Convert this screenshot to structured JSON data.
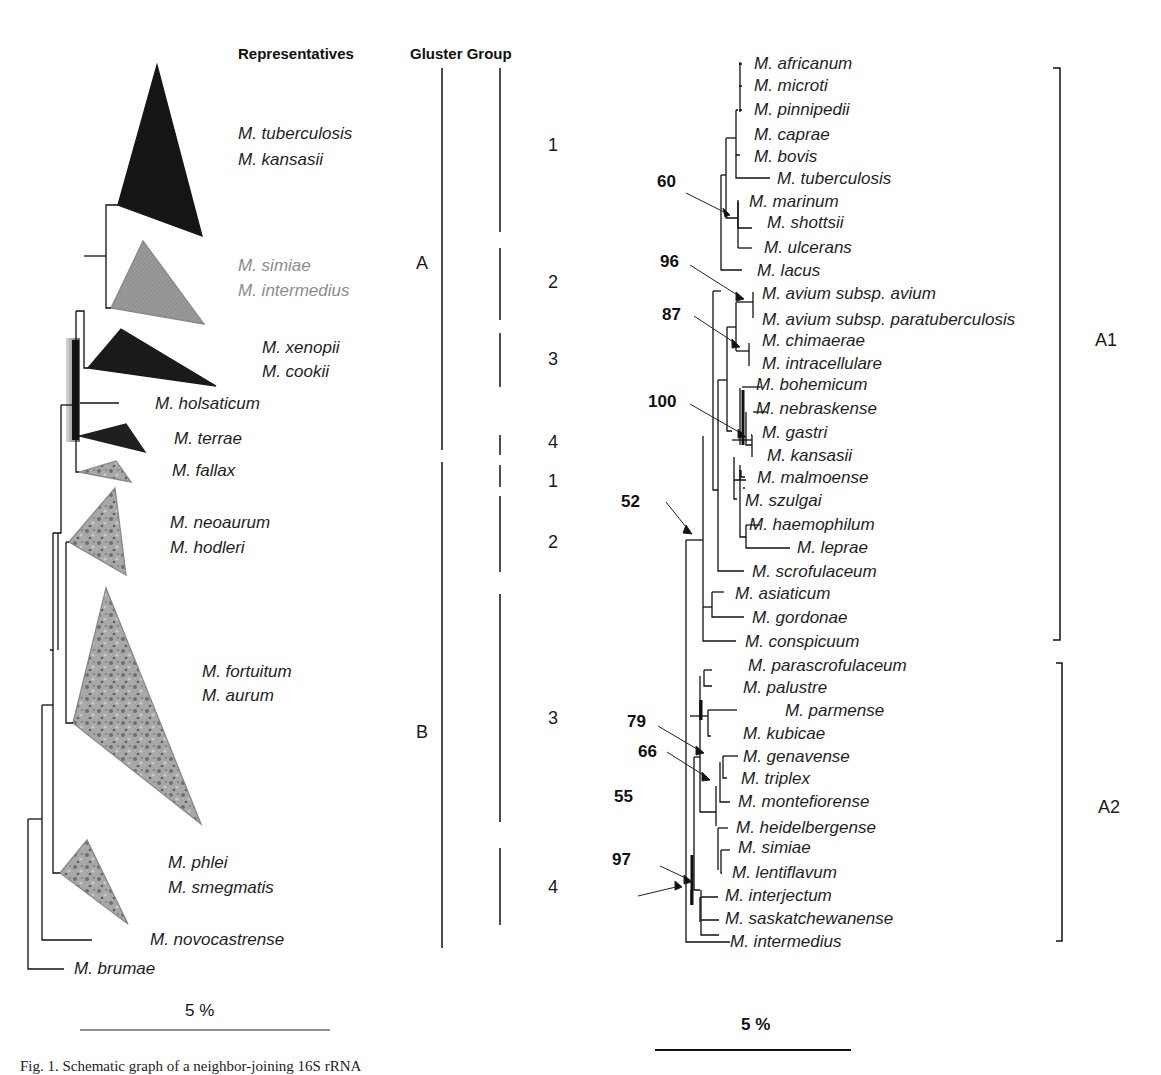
{
  "left_panel": {
    "headers": {
      "representatives": "Representatives",
      "cluster_group": "Gluster Group"
    },
    "clades": [
      {
        "labels": [
          "M. tuberculosis",
          "M. kansasii"
        ],
        "style": "black",
        "cluster": "A",
        "group": "1"
      },
      {
        "labels": [
          "M. simiae",
          "M. intermedius"
        ],
        "style": "grey",
        "cluster": "A",
        "group": "2"
      },
      {
        "labels": [
          "M. xenopii",
          "M. cookii"
        ],
        "style": "black",
        "cluster": "A",
        "group": "3"
      },
      {
        "labels": [
          "M. holsaticum"
        ],
        "style": "branch",
        "cluster": "A",
        "group": ""
      },
      {
        "labels": [
          "M. terrae"
        ],
        "style": "black",
        "cluster": "A",
        "group": "4"
      },
      {
        "labels": [
          "M. fallax"
        ],
        "style": "textured",
        "cluster": "B",
        "group": "1"
      },
      {
        "labels": [
          "M. neoaurum",
          "M. hodleri"
        ],
        "style": "textured",
        "cluster": "B",
        "group": "2"
      },
      {
        "labels": [
          "M. fortuitum",
          "M. aurum"
        ],
        "style": "textured",
        "cluster": "B",
        "group": "3"
      },
      {
        "labels": [
          "M. phlei",
          "M. smegmatis"
        ],
        "style": "textured",
        "cluster": "B",
        "group": "4"
      },
      {
        "labels": [
          "M. novocastrense"
        ],
        "style": "branch",
        "cluster": "B",
        "group": ""
      },
      {
        "labels": [
          "M. brumae"
        ],
        "style": "outgroup",
        "cluster": "",
        "group": ""
      }
    ],
    "clusters": [
      "A",
      "B"
    ],
    "groups_A": [
      "1",
      "2",
      "3",
      "4"
    ],
    "groups_B": [
      "1",
      "2",
      "3",
      "4"
    ],
    "scale_bar": "5 %"
  },
  "right_panel": {
    "taxa": [
      "M. africanum",
      "M. microti",
      "M. pinnipedii",
      "M. caprae",
      "M. bovis",
      "M. tuberculosis",
      "M. marinum",
      "M. shottsii",
      "M. ulcerans",
      "M. lacus",
      "M. avium subsp. avium",
      "M. avium subsp. paratuberculosis",
      "M. chimaerae",
      "M. intracellulare",
      "M. bohemicum",
      "M. nebraskense",
      "M. gastri",
      "M. kansasii",
      "M. malmoense",
      "M. szulgai",
      "M. haemophilum",
      "M. leprae",
      "M. scrofulaceum",
      "M. asiaticum",
      "M. gordonae",
      "M. conspicuum",
      "M. parascrofulaceum",
      "M. palustre",
      "M. parmense",
      "M. kubicae",
      "M. genavense",
      "M. triplex",
      "M. montefiorense",
      "M. heidelbergense",
      "M. simiae",
      "M. lentiflavum",
      "M. interjectum",
      "M. saskatchewanense",
      "M. intermedius"
    ],
    "bootstrap": [
      "60",
      "96",
      "87",
      "100",
      "52",
      "79",
      "66",
      "55",
      "97"
    ],
    "brackets": [
      "A1",
      "A2"
    ],
    "scale_bar": "5 %"
  },
  "caption": "Fig. 1. Schematic graph of a neighbor-joining 16S rRNA"
}
